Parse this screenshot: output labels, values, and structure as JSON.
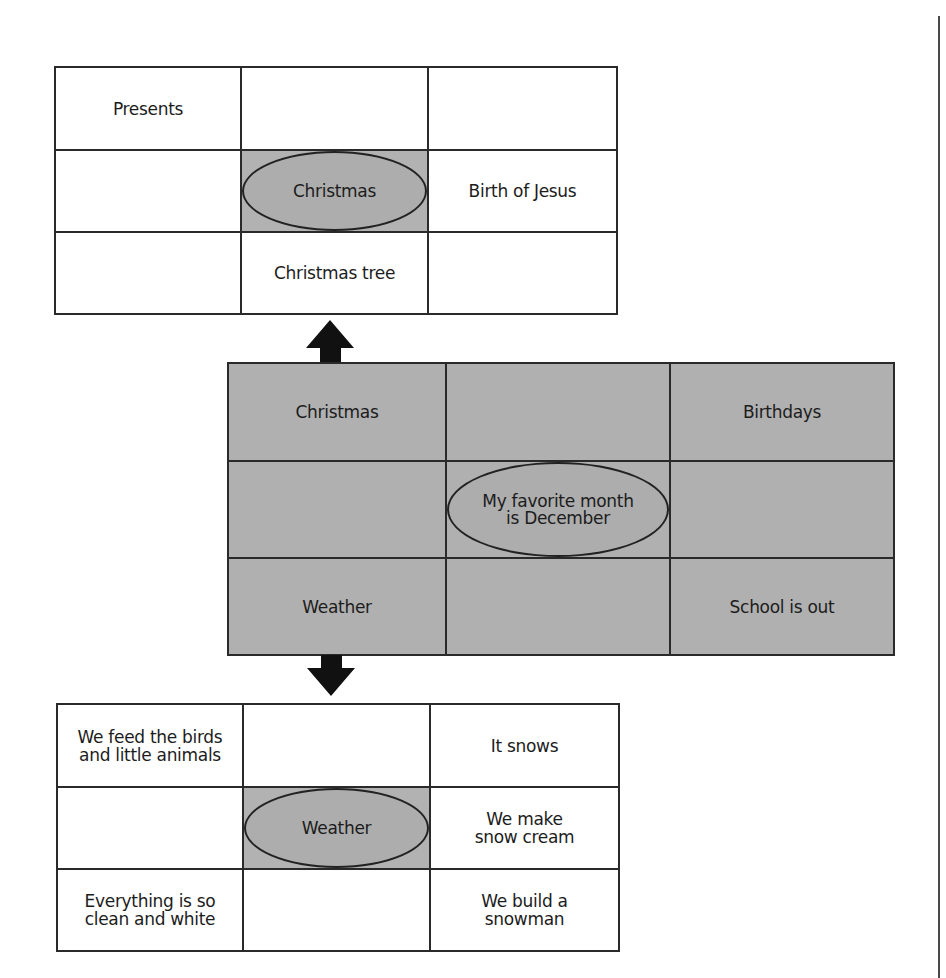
{
  "diagram": {
    "type": "lotus-diagram",
    "colors": {
      "line": "#2a2a2a",
      "shade": "#b0b0b0",
      "background": "#ffffff"
    },
    "top_grid": {
      "center": "Christmas",
      "cells": [
        [
          "Presents",
          "",
          ""
        ],
        [
          "",
          "Christmas",
          "Birth of Jesus"
        ],
        [
          "",
          "Christmas tree",
          ""
        ]
      ]
    },
    "middle_grid": {
      "center": "My favorite month is December",
      "center_lines": [
        "My favorite month",
        "is December"
      ],
      "cells": [
        [
          "Christmas",
          "",
          "Birthdays"
        ],
        [
          "",
          "My favorite month is December",
          ""
        ],
        [
          "Weather",
          "",
          "School is out"
        ]
      ]
    },
    "bottom_grid": {
      "center": "Weather",
      "cells": [
        [
          "We feed the birds and little animals",
          "",
          "It snows"
        ],
        [
          "",
          "Weather",
          "We make snow cream"
        ],
        [
          "Everything is so clean and white",
          "",
          "We build a snowman"
        ]
      ]
    },
    "arrows": [
      {
        "name": "up-arrow",
        "from": "middle_grid.Christmas",
        "to": "top_grid"
      },
      {
        "name": "down-arrow",
        "from": "middle_grid.Weather",
        "to": "bottom_grid"
      }
    ]
  }
}
